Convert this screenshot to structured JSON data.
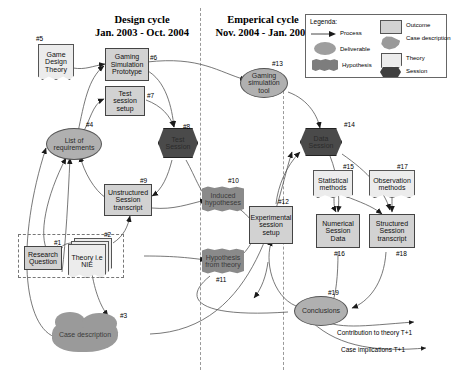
{
  "cycles": [
    {
      "name": "design",
      "title": "Design cycle",
      "dates": "Jan. 2003 - Oct. 2004"
    },
    {
      "name": "empirical",
      "title": "Emperical cycle",
      "dates": "Nov. 2004 - Jan. 2006"
    }
  ],
  "legend": {
    "title": "Legenda:",
    "items": [
      {
        "key": "process",
        "label": "Process",
        "shape": "arrow"
      },
      {
        "key": "deliverable",
        "label": "Deliverable",
        "shape": "ellipse"
      },
      {
        "key": "hypothesis",
        "label": "Hypothesis",
        "shape": "wave"
      },
      {
        "key": "outcome",
        "label": "Outcome",
        "shape": "rectangle"
      },
      {
        "key": "case_description",
        "label": "Case description",
        "shape": "cloud"
      },
      {
        "key": "theory",
        "label": "Theory",
        "shape": "document"
      },
      {
        "key": "session",
        "label": "Session",
        "shape": "hexagon"
      }
    ]
  },
  "nodes": [
    {
      "id": "1",
      "tag": "#1",
      "label": "Research Question",
      "kind": "outcome"
    },
    {
      "id": "2",
      "tag": "#2",
      "label": "Theory i.e NIE",
      "kind": "theory-stack"
    },
    {
      "id": "3",
      "tag": "#3",
      "label": "Case description",
      "kind": "case"
    },
    {
      "id": "4",
      "tag": "#4",
      "label": "List of requirements",
      "kind": "deliverable"
    },
    {
      "id": "5",
      "tag": "#5",
      "label": "Game Design Theory",
      "kind": "theory"
    },
    {
      "id": "6",
      "tag": "#6",
      "label": "Gaming Simulation Prototype",
      "kind": "outcome"
    },
    {
      "id": "7",
      "tag": "#7",
      "label": "Test session setup",
      "kind": "outcome"
    },
    {
      "id": "8",
      "tag": "#8",
      "label": "Test Session",
      "kind": "session"
    },
    {
      "id": "9",
      "tag": "#9",
      "label": "Unstructured Session transcript",
      "kind": "outcome"
    },
    {
      "id": "10",
      "tag": "#10",
      "label": "Induced hypotheses",
      "kind": "hypothesis"
    },
    {
      "id": "11",
      "tag": "#11",
      "label": "Hypothesis from theory",
      "kind": "hypothesis"
    },
    {
      "id": "12",
      "tag": "#12",
      "label": "Experimental session setup",
      "kind": "outcome"
    },
    {
      "id": "13",
      "tag": "#13",
      "label": "Gaming simulation tool",
      "kind": "deliverable"
    },
    {
      "id": "14",
      "tag": "#14",
      "label": "Data Session",
      "kind": "session"
    },
    {
      "id": "15",
      "tag": "#15",
      "label": "Statistical methods",
      "kind": "theory"
    },
    {
      "id": "16",
      "tag": "#16",
      "label": "Numerical Session Data",
      "kind": "outcome"
    },
    {
      "id": "17",
      "tag": "#17",
      "label": "Observation methods",
      "kind": "theory"
    },
    {
      "id": "18",
      "tag": "#18",
      "label": "Structured Session transcript",
      "kind": "outcome"
    },
    {
      "id": "19",
      "tag": "#19",
      "label": "Conclusions",
      "kind": "deliverable"
    }
  ],
  "outputs": [
    {
      "key": "contribution",
      "label": "Contribution to theory T+1"
    },
    {
      "key": "implications",
      "label": "Case implications T+1"
    }
  ],
  "colors": {
    "outcome": "#d2d2d2",
    "deliverable": "#b0b0b0",
    "hypothesis": "#8a8a8a",
    "session": "#4a4a4a",
    "theory": "#ececec",
    "case": "#9a9a9a",
    "stroke": "#555555",
    "divider": "#9a9a9a"
  }
}
